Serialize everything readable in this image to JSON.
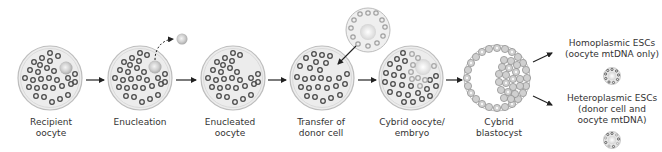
{
  "diagram": {
    "colors": {
      "cell_fill": "#ececec",
      "cell_border": "#b8b8b8",
      "oocyte_mito": "#4a4a4a",
      "donor_mito": "#a8a8a8",
      "nucleus": "#c4c4c4",
      "arrow": "#222222",
      "text": "#333333"
    },
    "steps": [
      {
        "id": "recipient-oocyte",
        "line1": "Recipient",
        "line2": "oocyte"
      },
      {
        "id": "enucleation",
        "line1": "Enucleation",
        "line2": ""
      },
      {
        "id": "enucleated-oocyte",
        "line1": "Enucleated",
        "line2": "oocyte"
      },
      {
        "id": "transfer-donor-cell",
        "line1": "Transfer of",
        "line2": "donor cell"
      },
      {
        "id": "cybrid-oocyte-embryo",
        "line1": "Cybrid oocyte/",
        "line2": "embryo"
      },
      {
        "id": "cybrid-blastocyst",
        "line1": "Cybrid",
        "line2": "blastocyst"
      }
    ],
    "outcomes": [
      {
        "id": "homoplasmic",
        "line1": "Homoplasmic ESCs",
        "line2": "(oocyte mtDNA only)",
        "line3": ""
      },
      {
        "id": "heteroplasmic",
        "line1": "Heteroplasmic ESCs",
        "line2": "(donor cell and",
        "line3": "oocyte mtDNA)"
      }
    ]
  }
}
